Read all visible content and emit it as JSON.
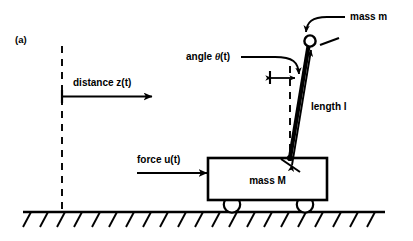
{
  "figure": {
    "panel_label": "(a)",
    "caption_alt": "Inverted pendulum on a cart",
    "colors": {
      "ink": "#000000",
      "background": "#ffffff"
    },
    "labels": {
      "mass_pendulum": "mass m",
      "angle": "angle",
      "angle_symbol": "θ",
      "angle_arg": "(t)",
      "length": "length l",
      "distance": "distance  z(t)",
      "force": "force  u(t)",
      "mass_cart": "mass  M"
    },
    "geometry": {
      "ground_y": 212,
      "ground_x0": 23,
      "ground_x1": 385,
      "hatch_count": 21,
      "hatch_spacing": 17.2,
      "hatch_length": 15,
      "cart": {
        "x": 208,
        "y": 158,
        "w": 119,
        "h": 42
      },
      "wheels": [
        {
          "cx": 232,
          "cy": 205,
          "r": 8
        },
        {
          "cx": 305,
          "cy": 205,
          "r": 8
        }
      ],
      "pivot": {
        "x": 290,
        "y": 158
      },
      "bob": {
        "cx": 310,
        "cy": 41,
        "r": 5.5
      },
      "reference_line": {
        "x": 62,
        "y0": 46,
        "y1": 212
      },
      "vertical_dashed_at_pivot": {
        "x": 290,
        "y0": 66,
        "y1": 158
      }
    },
    "icons": {
      "arrow_right": "distance-arrow",
      "force_arrow": "force-arrow",
      "length_double_arrow": "length-arrow",
      "angle_double_arrow": "angle-arrow",
      "curved_pointer_mass": "mass-m-leader",
      "curved_pointer_angle": "angle-leader"
    }
  }
}
